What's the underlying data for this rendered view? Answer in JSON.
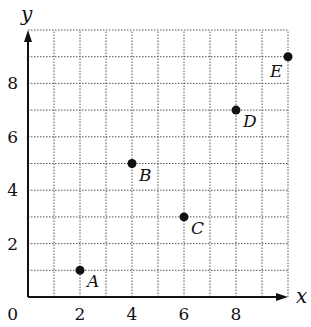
{
  "chart_data": {
    "type": "scatter",
    "title": "",
    "xlabel": "x",
    "ylabel": "y",
    "xlim": [
      0,
      10
    ],
    "ylim": [
      0,
      10
    ],
    "grid": true,
    "grid_style": "dotted",
    "x_ticks": [
      2,
      4,
      6,
      8
    ],
    "y_ticks": [
      2,
      4,
      6,
      8
    ],
    "origin_label": "0",
    "points": [
      {
        "label": "A",
        "x": 2,
        "y": 1
      },
      {
        "label": "B",
        "x": 4,
        "y": 5
      },
      {
        "label": "C",
        "x": 6,
        "y": 3
      },
      {
        "label": "D",
        "x": 8,
        "y": 7
      },
      {
        "label": "E",
        "x": 10,
        "y": 9
      }
    ],
    "legend": null
  },
  "layout": {
    "origin_px": [
      28,
      297
    ],
    "unit_px_x": 26,
    "unit_px_y": 26.7,
    "colors": {
      "axis": "#111111",
      "grid": "#555555",
      "point": "#111111"
    }
  }
}
